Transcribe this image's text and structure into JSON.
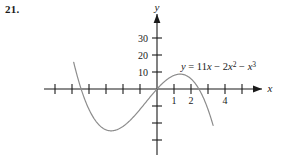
{
  "problem": {
    "number": "21."
  },
  "chart_data": {
    "type": "line",
    "title": "",
    "equation_label": "y = 11x − 2x² − x³",
    "equation_parts": {
      "y": "y",
      "equals": "=",
      "term1": "11",
      "term1_var": "x",
      "minus1": "−",
      "term2": "2",
      "term2_var": "x",
      "term2_exp": "2",
      "minus2": "−",
      "term3_var": "x",
      "term3_exp": "3"
    },
    "function": "y = 11x - 2x^2 - x^3",
    "xlabel": "x",
    "ylabel": "y",
    "x_tick_labels": [
      "1",
      "2",
      "4"
    ],
    "x_tick_values": [
      1,
      2,
      4
    ],
    "y_tick_labels": [
      "10",
      "20",
      "30"
    ],
    "y_tick_values": [
      10,
      20,
      30
    ],
    "x_unlabeled_ticks": [
      -6,
      -5,
      -4,
      -3,
      -2,
      -1,
      3,
      5,
      6
    ],
    "y_unlabeled_ticks": [
      -10,
      -20,
      -30
    ],
    "xlim": [
      -6.8,
      6.2
    ],
    "ylim": [
      -45,
      45
    ],
    "grid": false,
    "legend": "none",
    "axis_color": "#1a1a1a",
    "curve_color": "#8c8c8c",
    "x_intercepts": [
      -4.0,
      0,
      2.4
    ],
    "local_min": {
      "x": -2.46,
      "y": -19.0
    },
    "local_max": {
      "x": 1.13,
      "y": 7.6
    },
    "curve_domain": [
      -4.9,
      3.3
    ],
    "points": [
      {
        "x": -4.9,
        "y": -23.9
      },
      {
        "x": -4.7,
        "y": -15.6
      },
      {
        "x": -4.5,
        "y": -8.1
      },
      {
        "x": -4.3,
        "y": -1.3
      },
      {
        "x": -4.1,
        "y": 4.8
      },
      {
        "x": -4.0,
        "y": 7.6
      },
      {
        "x": -3.8,
        "y": 12.6
      },
      {
        "x": -3.6,
        "y": 16.9
      },
      {
        "x": -3.4,
        "y": 20.5
      },
      {
        "x": -3.2,
        "y": 23.4
      },
      {
        "x": -3.0,
        "y": 25.7
      },
      {
        "x": -2.8,
        "y": 27.4
      },
      {
        "x": -2.6,
        "y": 28.5
      },
      {
        "x": -2.46,
        "y": 29.0
      },
      {
        "x": -2.2,
        "y": 29.2
      },
      {
        "x": -2.0,
        "y": 28.5
      },
      {
        "x": -1.8,
        "y": 27.2
      },
      {
        "x": -1.5,
        "y": 24.4
      },
      {
        "x": -1.2,
        "y": 20.7
      },
      {
        "x": -1.0,
        "y": 18.0
      },
      {
        "x": -0.8,
        "y": 15.0
      },
      {
        "x": -0.5,
        "y": 10.2
      },
      {
        "x": -0.2,
        "y": 5.1
      },
      {
        "x": 0.0,
        "y": 0.0
      },
      {
        "x": 0.3,
        "y": 3.1
      },
      {
        "x": 0.6,
        "y": 5.9
      },
      {
        "x": 0.9,
        "y": 7.5
      },
      {
        "x": 1.13,
        "y": 7.9
      },
      {
        "x": 1.4,
        "y": 7.4
      },
      {
        "x": 1.7,
        "y": 5.0
      },
      {
        "x": 2.0,
        "y": 6.0
      },
      {
        "x": 2.2,
        "y": 2.9
      },
      {
        "x": 2.4,
        "y": -0.6
      },
      {
        "x": 2.6,
        "y": -4.7
      },
      {
        "x": 2.8,
        "y": -9.4
      },
      {
        "x": 3.0,
        "y": -14.9
      },
      {
        "x": 3.2,
        "y": -21.1
      },
      {
        "x": 3.3,
        "y": -24.5
      }
    ]
  }
}
